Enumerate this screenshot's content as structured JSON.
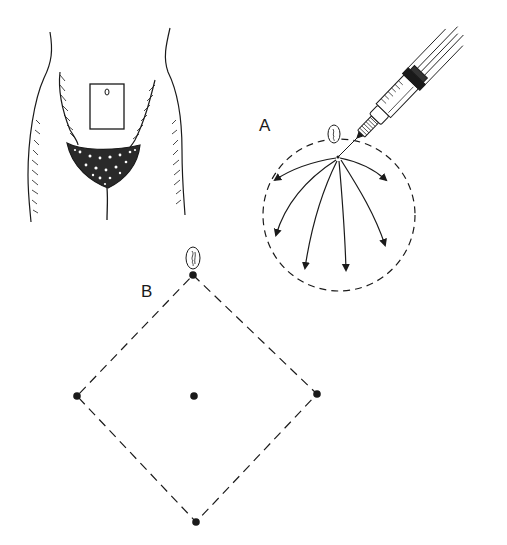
{
  "figure": {
    "panels": [
      {
        "id": "torso",
        "description": "Lower abdomen with rectangular injection area below umbilicus"
      },
      {
        "id": "A",
        "label": "A",
        "description": "Needle inserted near umbilicus, fanning injections radially within dashed circle"
      },
      {
        "id": "B",
        "label": "B",
        "description": "Dashed diamond with injection points at four corners and center, umbilicus at top corner"
      }
    ],
    "colors": {
      "ink": "#1a1a1a",
      "background": "#ffffff"
    }
  }
}
